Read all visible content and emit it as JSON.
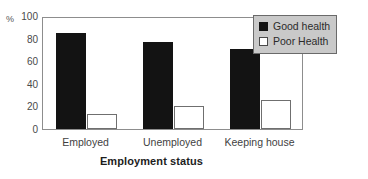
{
  "chart_data": {
    "type": "bar",
    "title": "",
    "xlabel": "Employment status",
    "ylabel": "%",
    "categories": [
      "Employed",
      "Unemployed",
      "Keeping house"
    ],
    "series": [
      {
        "name": "Good health",
        "color": "#131313",
        "values": [
          85,
          77,
          71
        ]
      },
      {
        "name": "Poor Health",
        "color": "#ffffff",
        "values": [
          13,
          20,
          26
        ]
      }
    ],
    "ylim": [
      0,
      100
    ],
    "yticks": [
      0,
      20,
      40,
      60,
      80,
      100
    ],
    "ytick_labels": [
      "0",
      "20",
      "40",
      "60",
      "80",
      "100"
    ],
    "grid": false,
    "legend_position": "top-right"
  },
  "axes": {
    "y_unit_label": "%",
    "x_title": "Employment status"
  },
  "legend": {
    "items": [
      {
        "label": "Good health",
        "swatch": "filled-black-square"
      },
      {
        "label": "Poor Health",
        "swatch": "empty-white-square"
      }
    ]
  },
  "colors": {
    "good_health_fill": "#131313",
    "poor_health_fill": "#ffffff",
    "poor_health_border": "#6f6f6f",
    "plot_border": "#8d8d8d",
    "legend_background": "#c9c9c9",
    "legend_border": "#6a6a6a",
    "background": "#ffffff"
  }
}
